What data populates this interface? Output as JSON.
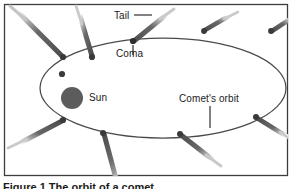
{
  "figure": {
    "caption": "Figure 1 The orbit of a comet",
    "frame_color": "#3d3d3d",
    "background": "#ffffff"
  },
  "diagram": {
    "orbit": {
      "name": "Comet's orbit",
      "stroke": "#4a4a4a",
      "center_x": 163,
      "center_y": 88,
      "radius_x": 123,
      "radius_y": 50
    },
    "sun": {
      "label": "Sun",
      "fill": "#5c5c5c",
      "cx": 72,
      "cy": 98,
      "r": 11
    },
    "comet_color": "#58585a",
    "coma_color": "#3a3a3a"
  },
  "labels": {
    "tail": "Tail",
    "coma": "Coma",
    "sun": "Sun",
    "orbit": "Comet's orbit"
  },
  "comets": [
    {
      "id": "comet-top-left-far",
      "name": "comet-top-left-far"
    },
    {
      "id": "comet-top-left",
      "name": "comet-top-left"
    },
    {
      "id": "comet-coma-labeled",
      "name": "comet-labeled-coma"
    },
    {
      "id": "comet-top-right",
      "name": "comet-top-right"
    },
    {
      "id": "comet-top-right-far",
      "name": "comet-top-right-far"
    },
    {
      "id": "comet-right",
      "name": "comet-right-edge"
    },
    {
      "id": "comet-bottom-right",
      "name": "comet-bottom-right"
    },
    {
      "id": "comet-bottom-center",
      "name": "comet-bottom-center"
    },
    {
      "id": "comet-bottom-left",
      "name": "comet-bottom-left"
    },
    {
      "id": "comet-left",
      "name": "comet-left-perihelion"
    }
  ]
}
